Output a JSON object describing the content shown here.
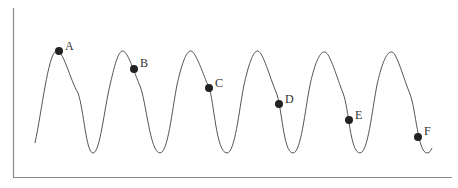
{
  "diagram": {
    "type": "periodic-wave",
    "colors": {
      "axis": "#8a8a8a",
      "curve": "#555555",
      "point": "#222222",
      "label": "#333333"
    },
    "axes": {
      "x_label": "",
      "y_label": ""
    },
    "points": [
      {
        "label": "A",
        "cycle": 1,
        "x": 59,
        "y": 51
      },
      {
        "label": "B",
        "cycle": 2,
        "x": 134,
        "y": 69
      },
      {
        "label": "C",
        "cycle": 3,
        "x": 209,
        "y": 88
      },
      {
        "label": "D",
        "cycle": 4,
        "x": 279,
        "y": 104
      },
      {
        "label": "E",
        "cycle": 5,
        "x": 349,
        "y": 120
      },
      {
        "label": "F",
        "cycle": 6,
        "x": 418,
        "y": 137
      }
    ]
  }
}
